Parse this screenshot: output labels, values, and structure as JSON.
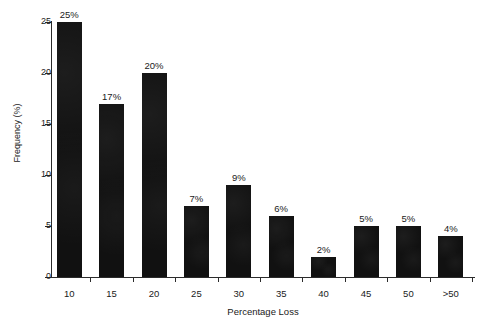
{
  "chart_data": {
    "type": "bar",
    "title": "",
    "xlabel": "Percentage Loss",
    "ylabel": "Frequency (%)",
    "categories": [
      "10",
      "15",
      "20",
      "25",
      "30",
      "35",
      "40",
      "45",
      "50",
      ">50"
    ],
    "values": [
      25,
      17,
      20,
      7,
      9,
      6,
      2,
      5,
      5,
      4
    ],
    "data_labels": [
      "25%",
      "17%",
      "20%",
      "7%",
      "9%",
      "6%",
      "2%",
      "5%",
      "5%",
      "4%"
    ],
    "ylim": [
      0,
      25
    ],
    "y_ticks": [
      0,
      5,
      10,
      15,
      20,
      25
    ],
    "y_tick_labels": [
      "0",
      "5",
      "10",
      "15",
      "20",
      "25"
    ],
    "grid": false,
    "legend": null,
    "bar_color": "#111111",
    "axis_color": "#2b2b2b",
    "background_color": "#ffffff"
  }
}
